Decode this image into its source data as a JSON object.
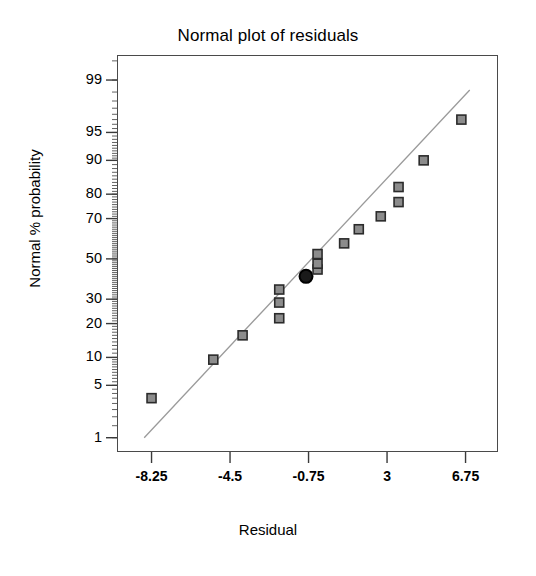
{
  "chart_data": {
    "type": "scatter",
    "title": "Normal plot of residuals",
    "xlabel": "Residual",
    "ylabel": "Normal % probability",
    "grid": false,
    "legend": null,
    "xlim": [
      -9.9,
      8.3
    ],
    "ylim": [
      0.6,
      99.6
    ],
    "xticks": [
      -8.25,
      -4.5,
      -0.75,
      3,
      6.75
    ],
    "xtick_labels": [
      "-8.25",
      "-4.5",
      "-0.75",
      "3",
      "6.75"
    ],
    "yticks": [
      99,
      95,
      90,
      80,
      70,
      50,
      30,
      20,
      10,
      5,
      1
    ],
    "ytick_labels": [
      "99",
      "95",
      "90",
      "80",
      "70",
      "50",
      "30",
      "20",
      "10",
      "5",
      "1"
    ],
    "y_scale": "normal-probability",
    "points": [
      {
        "x": -8.25,
        "y": 3.5,
        "highlight": false
      },
      {
        "x": -5.3,
        "y": 9.5,
        "highlight": false
      },
      {
        "x": -3.9,
        "y": 16.0,
        "highlight": false
      },
      {
        "x": -2.15,
        "y": 22.0,
        "highlight": false
      },
      {
        "x": -2.15,
        "y": 28.5,
        "highlight": false
      },
      {
        "x": -2.15,
        "y": 34.5,
        "highlight": false
      },
      {
        "x": -0.87,
        "y": 41.0,
        "highlight": true
      },
      {
        "x": -0.32,
        "y": 44.5,
        "highlight": false
      },
      {
        "x": -0.32,
        "y": 47.5,
        "highlight": false
      },
      {
        "x": -0.32,
        "y": 52.5,
        "highlight": false
      },
      {
        "x": 0.95,
        "y": 58.0,
        "highlight": false
      },
      {
        "x": 1.65,
        "y": 65.0,
        "highlight": false
      },
      {
        "x": 2.7,
        "y": 71.0,
        "highlight": false
      },
      {
        "x": 3.55,
        "y": 77.0,
        "highlight": false
      },
      {
        "x": 3.55,
        "y": 82.5,
        "highlight": false
      },
      {
        "x": 4.75,
        "y": 90.0,
        "highlight": false
      },
      {
        "x": 6.55,
        "y": 96.5,
        "highlight": false
      }
    ],
    "reference_line": {
      "x_start": -8.6,
      "y_start": 1.0,
      "x_end": 6.95,
      "y_end": 98.6,
      "color": "#9a9a9a"
    },
    "marker": {
      "shape": "square",
      "fill": "#8c8c8c",
      "edge": "#2b2b2b",
      "size": 9
    },
    "highlight_marker": {
      "shape": "circle",
      "fill": "#1a1a1a",
      "edge": "#000000",
      "size": 13
    }
  },
  "axes": {
    "frame_color": "#4a4a4a",
    "tick_color": "#3a3a3a"
  }
}
